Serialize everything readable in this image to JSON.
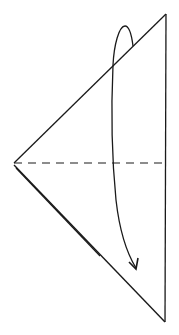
{
  "diagram": {
    "type": "origami-fold-step",
    "title": "",
    "stroke_color": "#1a1a1a",
    "background": "#ffffff",
    "shape": {
      "kind": "triangle",
      "vertices": {
        "top": [
          166,
          14
        ],
        "left": [
          14,
          163
        ],
        "bottom": [
          165,
          322
        ]
      },
      "double_edge": "left-to-bottom"
    },
    "fold_line": {
      "style": "dashed",
      "kind": "valley-fold",
      "from": [
        14,
        163
      ],
      "to": [
        166,
        163
      ]
    },
    "arrow": {
      "meaning": "fold top half down over bottom half",
      "direction": "down",
      "start": [
        133,
        46
      ],
      "end": [
        136,
        268
      ]
    }
  }
}
